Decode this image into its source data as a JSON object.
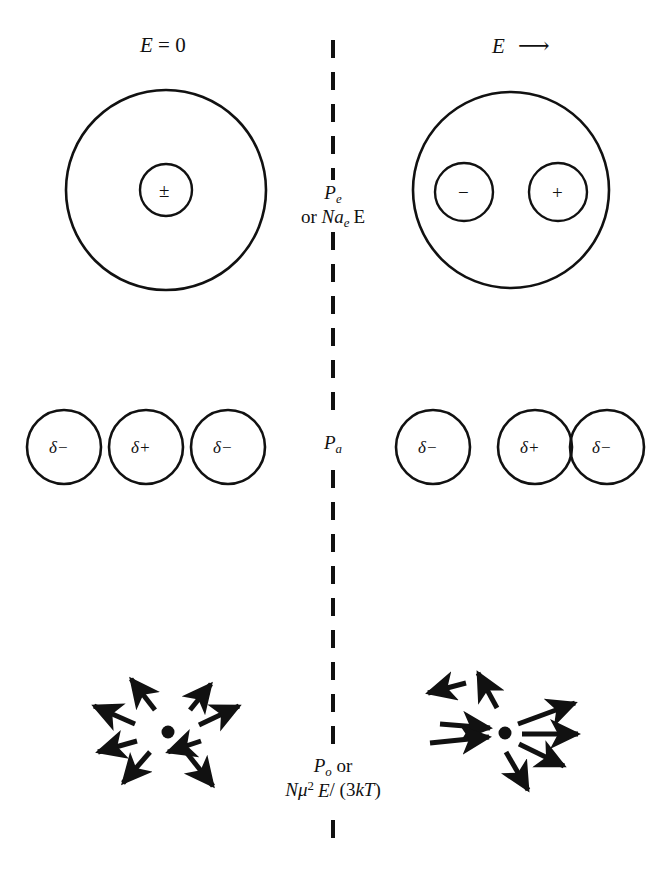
{
  "figure": {
    "title_left": "E = 0",
    "title_right": "E",
    "arrow_glyph": "right-arrow"
  },
  "headers": {
    "left": {
      "symbol": "E",
      "relation": "= 0"
    },
    "right": {
      "symbol": "E",
      "field_arrow": "⟶"
    }
  },
  "center_labels": {
    "electronic": {
      "line1_symbol": "P",
      "line1_sub": "e",
      "line2_prefix": "or ",
      "line2_N": "N",
      "line2_a": "a",
      "line2_a_sub": "e",
      "line2_E": "E"
    },
    "atomic": {
      "symbol": "P",
      "sub": "a"
    },
    "orientational": {
      "line1_symbol": "P",
      "line1_sub": "o",
      "line1_suffix": " or",
      "line2_N": "N",
      "line2_mu": "μ",
      "line2_exp": "2",
      "line2_E": "E",
      "line2_rest": "/ (3",
      "line2_k": "k",
      "line2_T": "T",
      "line2_close": ")"
    }
  },
  "rows": {
    "electronic": {
      "left_atom": {
        "core_label": "±"
      },
      "right_atom": {
        "negative_label": "−",
        "positive_label": "+"
      }
    },
    "atomic": {
      "left_chain": [
        "δ−",
        "δ+",
        "δ−"
      ],
      "right_chain": [
        "δ−",
        "δ+",
        "δ−"
      ]
    },
    "orientational": {
      "left_dipole_count": 8,
      "right_dipole_count": 8
    }
  },
  "colors": {
    "stroke": "#111111",
    "background": "#ffffff"
  }
}
